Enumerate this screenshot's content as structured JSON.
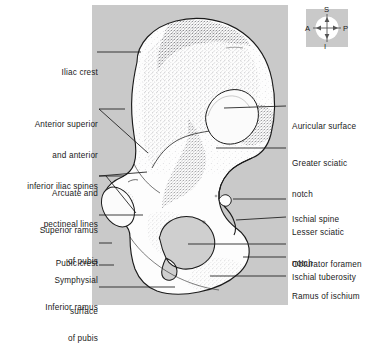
{
  "figure": {
    "plate_color": "#c9c9c9",
    "bone_fill": "#fdfdfd",
    "outline_color": "#1a1a1a",
    "text_color": "#1a1a1a"
  },
  "orientation_compass": {
    "name": "anatomical-orientation-compass",
    "superior": "S",
    "inferior": "I",
    "anterior": "A",
    "posterior": "P"
  },
  "labels_left": [
    {
      "id": "iliac-crest",
      "lines": [
        "Iliac crest"
      ],
      "x": 18,
      "y": 47,
      "width": 80
    },
    {
      "id": "anterior-superior-inferior-iliac-spines",
      "lines": [
        "Anterior superior",
        "and anterior",
        "inferior iliac spines"
      ],
      "x": 6,
      "y": 99,
      "width": 92
    },
    {
      "id": "arcuate-and-pectineal-lines",
      "lines": [
        "Arcuate and",
        "pectineal lines"
      ],
      "x": 18,
      "y": 168,
      "width": 80
    },
    {
      "id": "superior-ramus-of-pubis",
      "lines": [
        "Superior ramus",
        "of pubis"
      ],
      "x": 18,
      "y": 204,
      "width": 80
    },
    {
      "id": "pubic-crest",
      "lines": [
        "Pubic crest"
      ],
      "x": 18,
      "y": 238,
      "width": 80
    },
    {
      "id": "symphysial-surface",
      "lines": [
        "Symphysial",
        "surface"
      ],
      "x": 18,
      "y": 256,
      "width": 80
    },
    {
      "id": "inferior-ramus-of-pubis",
      "lines": [
        "Inferior ramus",
        "of pubis"
      ],
      "x": 18,
      "y": 282,
      "width": 80
    }
  ],
  "labels_right": [
    {
      "id": "auricular-surface",
      "lines": [
        "Auricular surface"
      ],
      "x": 292,
      "y": 100
    },
    {
      "id": "greater-sciatic-notch",
      "lines": [
        "Greater sciatic",
        "notch"
      ],
      "x": 292,
      "y": 139
    },
    {
      "id": "ischial-spine",
      "lines": [
        "Ischial spine"
      ],
      "x": 292,
      "y": 192
    },
    {
      "id": "lesser-sciatic-notch",
      "lines": [
        "Lesser sciatic",
        "notch"
      ],
      "x": 292,
      "y": 211
    },
    {
      "id": "obturator-foramen",
      "lines": [
        "Obturator foramen"
      ],
      "x": 292,
      "y": 239
    },
    {
      "id": "ischial-tuberosity",
      "lines": [
        "Ischial tuberosity"
      ],
      "x": 292,
      "y": 252
    },
    {
      "id": "ramus-of-ischium",
      "lines": [
        "Ramus of ischium"
      ],
      "x": 292,
      "y": 271
    }
  ]
}
